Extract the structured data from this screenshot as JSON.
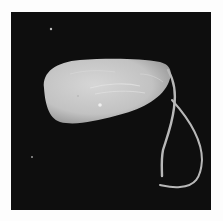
{
  "image": {
    "description": "Grayscale scanning electron micrograph of a single-celled flagellated protozoan with an oval body and two trailing flagella on a black background",
    "subject": "flagellated protozoan",
    "colors": {
      "border": "#fdfdfd",
      "background": "#0e0e0e",
      "body": "#c8c8c8",
      "flagella": "#b4b4b4"
    }
  }
}
